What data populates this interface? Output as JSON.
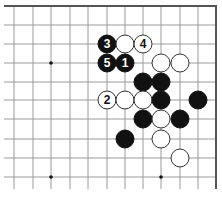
{
  "diagram": {
    "type": "go-board-fragment",
    "corner": "top-right",
    "board_color": "#ffffff",
    "line_color": "#9a9a9a",
    "edge_color": "#555555",
    "black_stone_color": "#111111",
    "white_stone_color": "#ffffff",
    "columns_x": [
      14,
      33,
      51,
      70,
      88,
      107,
      125,
      143,
      161,
      180,
      198
    ],
    "rows_y": [
      6,
      25,
      44,
      63,
      82,
      100,
      119,
      139,
      158,
      177
    ],
    "right_edge_x": 216,
    "top_edge_y": 6,
    "stone_radius": 9,
    "star_points": [
      {
        "col": 2,
        "row": 3
      },
      {
        "col": 2,
        "row": 9
      },
      {
        "col": 8,
        "row": 9
      }
    ],
    "stones": [
      {
        "color": "black",
        "col": 5,
        "row": 2,
        "label": "3"
      },
      {
        "color": "white",
        "col": 6,
        "row": 2,
        "label": ""
      },
      {
        "color": "white",
        "col": 7,
        "row": 2,
        "label": "4"
      },
      {
        "color": "black",
        "col": 5,
        "row": 3,
        "label": "5"
      },
      {
        "color": "black",
        "col": 6,
        "row": 3,
        "label": "1"
      },
      {
        "color": "white",
        "col": 8,
        "row": 3,
        "label": ""
      },
      {
        "color": "white",
        "col": 9,
        "row": 3,
        "label": ""
      },
      {
        "color": "black",
        "col": 7,
        "row": 4,
        "label": ""
      },
      {
        "color": "black",
        "col": 8,
        "row": 4,
        "label": ""
      },
      {
        "color": "white",
        "col": 5,
        "row": 5,
        "label": "2"
      },
      {
        "color": "white",
        "col": 6,
        "row": 5,
        "label": ""
      },
      {
        "color": "white",
        "col": 7,
        "row": 5,
        "label": ""
      },
      {
        "color": "black",
        "col": 8,
        "row": 5,
        "label": ""
      },
      {
        "color": "black",
        "col": 10,
        "row": 5,
        "label": ""
      },
      {
        "color": "black",
        "col": 7,
        "row": 6,
        "label": ""
      },
      {
        "color": "white",
        "col": 8,
        "row": 6,
        "label": ""
      },
      {
        "color": "black",
        "col": 9,
        "row": 6,
        "label": ""
      },
      {
        "color": "black",
        "col": 6,
        "row": 7,
        "label": ""
      },
      {
        "color": "white",
        "col": 8,
        "row": 7,
        "label": ""
      },
      {
        "color": "white",
        "col": 9,
        "row": 8,
        "label": ""
      }
    ]
  }
}
